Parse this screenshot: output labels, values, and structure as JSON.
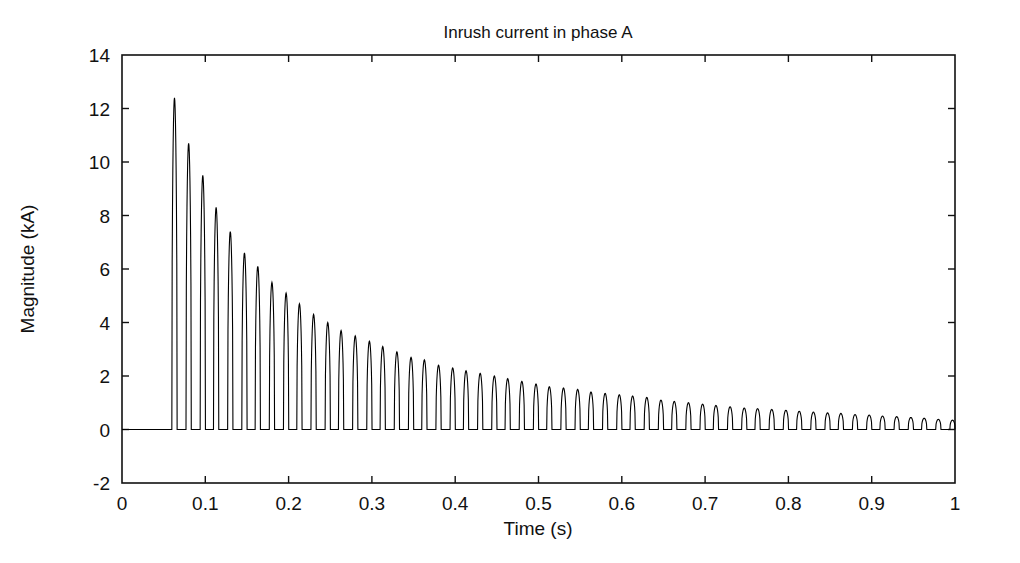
{
  "chart_data": {
    "type": "line",
    "title": "Inrush current in phase A",
    "xlabel": "Time (s)",
    "ylabel": "Magnitude (kA)",
    "xlim": [
      0,
      1
    ],
    "ylim": [
      -2,
      14
    ],
    "xticks": [
      0,
      0.1,
      0.2,
      0.3,
      0.4,
      0.5,
      0.6,
      0.7,
      0.8,
      0.9,
      1
    ],
    "xticklabels": [
      "0",
      "0.1",
      "0.2",
      "0.3",
      "0.4",
      "0.5",
      "0.6",
      "0.7",
      "0.8",
      "0.9",
      "1"
    ],
    "yticks": [
      -2,
      0,
      2,
      4,
      6,
      8,
      10,
      12,
      14
    ],
    "yticklabels": [
      "-2",
      "0",
      "2",
      "4",
      "6",
      "8",
      "10",
      "12",
      "14"
    ],
    "grid": false,
    "legend": null,
    "line_color": "#000000",
    "line_width": 1.1,
    "series_name": "Inrush current phase A",
    "waveform": {
      "description": "Unidirectional inrush current pulses, 60 Hz, exponentially decaying",
      "energization_time": 0.055,
      "pulse_frequency_hz": 60,
      "pulse_period_s": 0.01667,
      "pulse_duty_fraction": 0.38,
      "baseline_value": 0.0,
      "initial_peak_ka": 12.4,
      "final_peak_ka": 0.35,
      "decay_time_constant_s": 0.21,
      "decay_offset_ka": 0.3
    },
    "peaks": [
      {
        "t": 0.063,
        "value": 12.4
      },
      {
        "t": 0.08,
        "value": 10.7
      },
      {
        "t": 0.097,
        "value": 9.5
      },
      {
        "t": 0.113,
        "value": 8.3
      },
      {
        "t": 0.13,
        "value": 7.4
      },
      {
        "t": 0.147,
        "value": 6.6
      },
      {
        "t": 0.163,
        "value": 6.1
      },
      {
        "t": 0.18,
        "value": 5.5
      },
      {
        "t": 0.197,
        "value": 5.1
      },
      {
        "t": 0.213,
        "value": 4.7
      },
      {
        "t": 0.23,
        "value": 4.3
      },
      {
        "t": 0.247,
        "value": 4.0
      },
      {
        "t": 0.263,
        "value": 3.7
      },
      {
        "t": 0.28,
        "value": 3.5
      },
      {
        "t": 0.297,
        "value": 3.3
      },
      {
        "t": 0.313,
        "value": 3.1
      },
      {
        "t": 0.33,
        "value": 2.9
      },
      {
        "t": 0.347,
        "value": 2.7
      },
      {
        "t": 0.363,
        "value": 2.6
      },
      {
        "t": 0.38,
        "value": 2.4
      },
      {
        "t": 0.397,
        "value": 2.3
      },
      {
        "t": 0.413,
        "value": 2.2
      },
      {
        "t": 0.43,
        "value": 2.1
      },
      {
        "t": 0.447,
        "value": 2.0
      },
      {
        "t": 0.463,
        "value": 1.9
      },
      {
        "t": 0.48,
        "value": 1.8
      },
      {
        "t": 0.497,
        "value": 1.7
      },
      {
        "t": 0.513,
        "value": 1.6
      },
      {
        "t": 0.53,
        "value": 1.55
      },
      {
        "t": 0.547,
        "value": 1.5
      },
      {
        "t": 0.563,
        "value": 1.4
      },
      {
        "t": 0.58,
        "value": 1.35
      },
      {
        "t": 0.597,
        "value": 1.3
      },
      {
        "t": 0.613,
        "value": 1.25
      },
      {
        "t": 0.63,
        "value": 1.2
      },
      {
        "t": 0.647,
        "value": 1.1
      },
      {
        "t": 0.663,
        "value": 1.05
      },
      {
        "t": 0.68,
        "value": 1.0
      },
      {
        "t": 0.697,
        "value": 0.95
      },
      {
        "t": 0.713,
        "value": 0.9
      },
      {
        "t": 0.73,
        "value": 0.85
      },
      {
        "t": 0.747,
        "value": 0.8
      },
      {
        "t": 0.763,
        "value": 0.78
      },
      {
        "t": 0.78,
        "value": 0.75
      },
      {
        "t": 0.797,
        "value": 0.72
      },
      {
        "t": 0.813,
        "value": 0.68
      },
      {
        "t": 0.83,
        "value": 0.65
      },
      {
        "t": 0.847,
        "value": 0.62
      },
      {
        "t": 0.863,
        "value": 0.6
      },
      {
        "t": 0.88,
        "value": 0.56
      },
      {
        "t": 0.897,
        "value": 0.54
      },
      {
        "t": 0.913,
        "value": 0.5
      },
      {
        "t": 0.93,
        "value": 0.48
      },
      {
        "t": 0.947,
        "value": 0.45
      },
      {
        "t": 0.963,
        "value": 0.42
      },
      {
        "t": 0.98,
        "value": 0.38
      },
      {
        "t": 0.997,
        "value": 0.35
      }
    ]
  }
}
